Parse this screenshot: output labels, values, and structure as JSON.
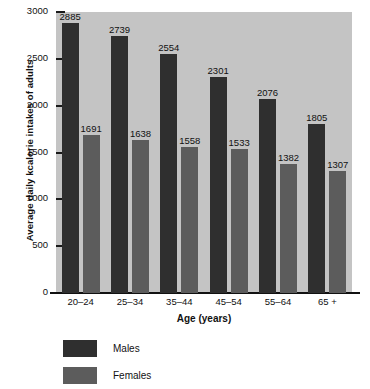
{
  "chart_data": {
    "type": "bar",
    "title": "",
    "xlabel": "Age (years)",
    "ylabel": "Average daily kcalorie intakes of adults",
    "categories": [
      "20–24",
      "25–34",
      "35–44",
      "45–54",
      "55–64",
      "65 +"
    ],
    "series": [
      {
        "name": "Males",
        "color": "#2f2f2f",
        "values": [
          2885,
          2739,
          2554,
          2301,
          2076,
          1805
        ]
      },
      {
        "name": "Females",
        "color": "#5c5c5c",
        "values": [
          1691,
          1638,
          1558,
          1533,
          1382,
          1307
        ]
      }
    ],
    "ylim": [
      0,
      3000
    ],
    "yticks": [
      0,
      500,
      1000,
      1500,
      2000,
      2500,
      3000
    ],
    "ytick_labels": [
      "0",
      "500",
      "1000",
      "1500",
      "2000",
      "2500",
      "3000"
    ],
    "grid": false,
    "legend_position": "bottom-left",
    "data_labels": true,
    "plot_background": "#c4c4c4"
  }
}
